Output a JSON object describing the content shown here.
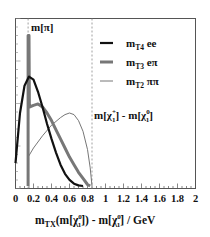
{
  "chart_data": {
    "type": "line",
    "title": "",
    "xlabel": "m_TX(m[χ1^0]) - m[χ1^0] / GeV",
    "xlabel_parts": {
      "m": "m",
      "sub": "TX",
      "mid": "(m[χ",
      "sup1": "0",
      "sub1": "1",
      "mid2": "]) - m[χ",
      "sup2": "0",
      "sub2": "1",
      "end": "] / GeV"
    },
    "ylabel": "",
    "xlim": [
      0,
      2
    ],
    "ylim": [
      0,
      1
    ],
    "x_ticks": [
      "0",
      "0.2",
      "0.4",
      "0.6",
      "0.8",
      "1",
      "1.2",
      "1.4",
      "1.6",
      "1.8",
      "2"
    ],
    "x_tick_values": [
      0,
      0.2,
      0.4,
      0.6,
      0.8,
      1.0,
      1.2,
      1.4,
      1.6,
      1.8,
      2.0
    ],
    "grid": false,
    "legend_position": "upper right",
    "series": [
      {
        "name": "m_T4 ee",
        "label_main": "m",
        "label_sub": "T4",
        "label_rest": " ee",
        "color": "#111111",
        "width": 2.2,
        "x": [
          0.0,
          0.05,
          0.1,
          0.15,
          0.2,
          0.25,
          0.3,
          0.35,
          0.4,
          0.45,
          0.5,
          0.55,
          0.6,
          0.65,
          0.7,
          0.75
        ],
        "y": [
          0.15,
          0.48,
          0.66,
          0.72,
          0.7,
          0.62,
          0.52,
          0.41,
          0.31,
          0.22,
          0.14,
          0.08,
          0.04,
          0.015,
          0.004,
          0.0
        ]
      },
      {
        "name": "m_T3 eπ",
        "label_main": "m",
        "label_sub": "T3",
        "label_rest": " eπ",
        "color": "#777777",
        "width": 3.0,
        "x": [
          0.14,
          0.14,
          0.15,
          0.155,
          0.2,
          0.25,
          0.3,
          0.35,
          0.4,
          0.45,
          0.5,
          0.55,
          0.6,
          0.65,
          0.7,
          0.75,
          0.8,
          0.83
        ],
        "y": [
          0.0,
          0.99,
          0.99,
          0.52,
          0.53,
          0.54,
          0.52,
          0.48,
          0.43,
          0.37,
          0.31,
          0.25,
          0.19,
          0.14,
          0.09,
          0.05,
          0.01,
          0.0
        ]
      },
      {
        "name": "m_T2 ππ",
        "label_main": "m",
        "label_sub": "T2",
        "label_rest": " ππ",
        "color": "#666666",
        "width": 0.9,
        "x": [
          0.14,
          0.2,
          0.3,
          0.4,
          0.5,
          0.55,
          0.6,
          0.65,
          0.7,
          0.75,
          0.8,
          0.83,
          0.85
        ],
        "y": [
          0.19,
          0.25,
          0.33,
          0.4,
          0.45,
          0.47,
          0.48,
          0.47,
          0.43,
          0.36,
          0.24,
          0.12,
          0.0
        ]
      }
    ],
    "annotations": [
      {
        "text": "m[π]",
        "x": 0.14,
        "type": "dashed-vline"
      },
      {
        "text": "m[χ1+] - m[χ1^0]",
        "x": 0.85,
        "type": "dashed-vline"
      }
    ]
  },
  "labels": {
    "m_pi": "m[π]",
    "chi_diff_a": "m[χ",
    "chi_diff_sup1": "+",
    "chi_diff_sub1": "1",
    "chi_diff_b": "] - m[χ",
    "chi_diff_sup2": "0",
    "chi_diff_sub2": "1",
    "chi_diff_c": "]"
  }
}
